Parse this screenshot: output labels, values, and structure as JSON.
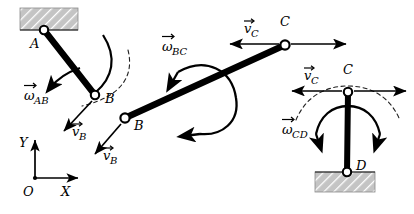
{
  "figure": {
    "background_color": "#ffffff",
    "ink_color": "#000000",
    "hatch_fill_color": "#bfbfbf",
    "dash_color": "#1a1a1a"
  },
  "labels": {
    "point_a": "A",
    "point_b1": "B",
    "point_b2": "B",
    "point_c1": "C",
    "point_c2": "C",
    "point_d": "D",
    "omega_ab": "AB",
    "omega_bc": "BC",
    "omega_cd": "CD",
    "v_b1": "B",
    "v_b2": "B",
    "v_c1": "C",
    "v_c2": "C",
    "omega_symbol": "ω",
    "v_symbol": "v",
    "axis_x": "X",
    "axis_y": "Y",
    "axis_origin": "O"
  },
  "geometry": {
    "link_ab": {
      "x1": 44,
      "y1": 30,
      "x2": 95,
      "y2": 95
    },
    "link_bc": {
      "x1": 125,
      "y1": 118,
      "x2": 285,
      "y2": 45
    },
    "link_cd": {
      "x1": 348,
      "y1": 92,
      "x2": 347,
      "y2": 172
    },
    "joint_a": {
      "cx": 44,
      "cy": 30,
      "r": 4.2
    },
    "joint_b1": {
      "cx": 95,
      "cy": 95,
      "r": 4.2
    },
    "joint_b2": {
      "cx": 125,
      "cy": 118,
      "r": 4.6
    },
    "joint_c1": {
      "cx": 285,
      "cy": 45,
      "r": 4.6
    },
    "joint_c2": {
      "cx": 348,
      "cy": 92,
      "r": 4.2
    },
    "joint_d": {
      "cx": 347,
      "cy": 172,
      "r": 4.2
    },
    "support_a": {
      "x": 20,
      "y": 8,
      "w": 58,
      "h": 22
    },
    "support_d": {
      "x": 315,
      "y": 172,
      "w": 60,
      "h": 20
    },
    "axes": {
      "origin_x": 35,
      "origin_y": 178,
      "x_end": 80,
      "y_end": 138
    }
  },
  "vectors": {
    "v_b1": {
      "x1": 92,
      "y1": 101,
      "x2": 62,
      "y2": 133,
      "label_x": 73,
      "label_y": 131
    },
    "v_b2": {
      "x1": 121,
      "y1": 124,
      "x2": 93,
      "y2": 156,
      "label_x": 104,
      "label_y": 155
    },
    "v_c1_left": {
      "x1": 278,
      "y1": 44,
      "x2": 228,
      "y2": 44
    },
    "v_c1_right": {
      "x1": 292,
      "y1": 44,
      "x2": 348,
      "y2": 44
    },
    "v_c2_left": {
      "x1": 341,
      "y1": 91,
      "x2": 291,
      "y2": 91
    },
    "v_c2_right": {
      "x1": 355,
      "y1": 91,
      "x2": 408,
      "y2": 91
    }
  },
  "annotations": {
    "omega_ab_arc": "curved single arrow counterclockwise near link AB",
    "omega_bc_arc": "large double-headed curved arrow around link BC",
    "omega_cd_arc": "double-headed curved arrow around link CD",
    "dashed_path_b": "dashed circular path arc through joint B",
    "dashed_path_c": "dashed circular path arc through joint C"
  }
}
